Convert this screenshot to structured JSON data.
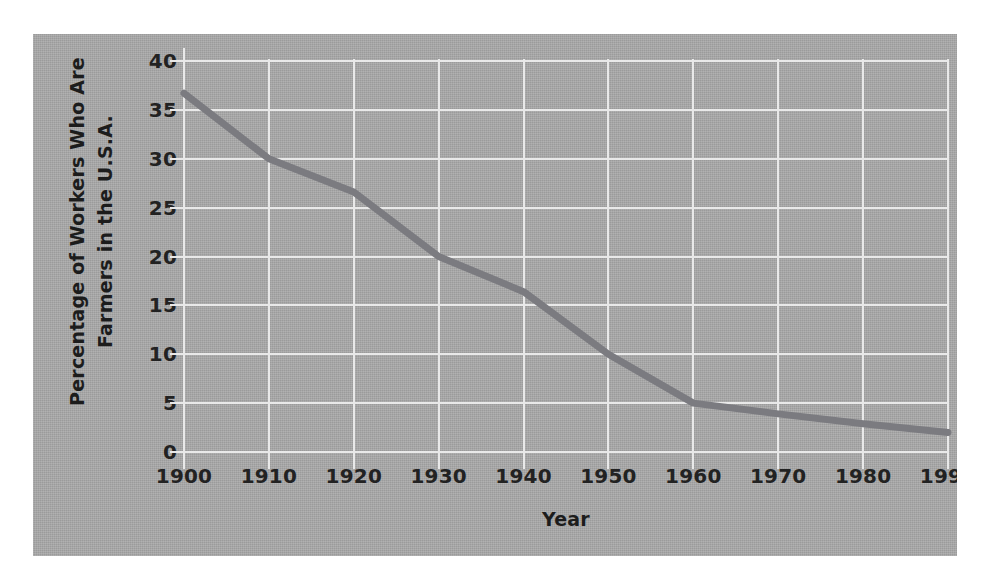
{
  "chart_data": {
    "type": "line",
    "title": "",
    "xlabel": "Year",
    "ylabel": "Percentage of Workers Who Are Farmers in the U.S.A.",
    "ylabel_line1": "Percentage of Workers Who Are",
    "ylabel_line2": "Farmers in the U.S.A.",
    "x": [
      1900,
      1910,
      1920,
      1930,
      1940,
      1950,
      1960,
      1970,
      1980,
      1990
    ],
    "values": [
      36.7,
      30.0,
      26.6,
      20.0,
      16.4,
      10.0,
      5.0,
      3.9,
      2.9,
      2.0
    ],
    "series": [
      {
        "name": "Percentage of workers who are farmers",
        "values": [
          36.7,
          30.0,
          26.6,
          20.0,
          16.4,
          10.0,
          5.0,
          3.9,
          2.9,
          2.0
        ]
      }
    ],
    "xtick_labels": [
      "1900",
      "1910",
      "1920",
      "1930",
      "1940",
      "1950",
      "1960",
      "1970",
      "1980",
      "1990"
    ],
    "ytick_labels": [
      "40",
      "35",
      "30",
      "25",
      "20",
      "15",
      "10",
      "5",
      "0"
    ],
    "yticks": [
      40,
      35,
      30,
      25,
      20,
      15,
      10,
      5,
      0
    ],
    "xlim": [
      1900,
      1990
    ],
    "ylim": [
      0,
      40
    ],
    "grid": "both",
    "legend": "none",
    "colors": {
      "panel_background": "#a9a9a9",
      "gridline": "#e9e9e9",
      "line": "#7b7b80",
      "text": "#1c1c1c",
      "figure_background": "#ffffff"
    },
    "line_width_px": 7,
    "markers": "none",
    "annotations": []
  }
}
